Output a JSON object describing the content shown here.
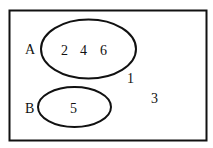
{
  "diagram": {
    "type": "venn",
    "universal_set": {
      "elements": [
        "1",
        "3"
      ]
    },
    "sets": [
      {
        "name": "A",
        "elements": [
          "2",
          "4",
          "6"
        ]
      },
      {
        "name": "B",
        "elements": [
          "5"
        ]
      }
    ],
    "outside_elements": {
      "first": "1",
      "second": "3"
    },
    "labels": {
      "set_a": "A",
      "set_b": "B",
      "a_el_1": "2",
      "a_el_2": "4",
      "a_el_3": "6",
      "b_el_1": "5"
    },
    "colors": {
      "stroke": "#111111",
      "background": "#ffffff"
    }
  }
}
